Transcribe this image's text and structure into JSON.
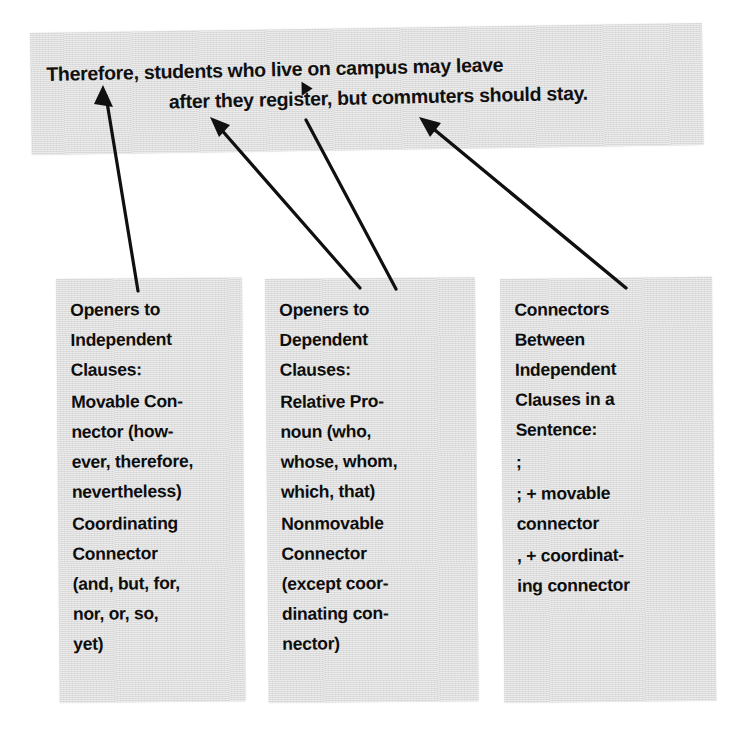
{
  "banner": {
    "line1": "Therefore, students who live on campus may leave",
    "line2": "after they register, but commuters should stay.",
    "marker": "triangle-marker"
  },
  "columns": [
    {
      "id": "openers-independent",
      "blocks": [
        {
          "lines": [
            "Openers to",
            "Independent",
            "Clauses:"
          ]
        },
        {
          "lines": [
            "Movable Con-",
            "nector (how-",
            "ever, therefore,",
            "nevertheless)"
          ]
        },
        {
          "lines": [
            "Coordinating",
            "Connector",
            "(and, but, for,",
            "nor, or, so,",
            "yet)"
          ]
        }
      ]
    },
    {
      "id": "openers-dependent",
      "blocks": [
        {
          "lines": [
            "Openers to",
            "Dependent",
            "Clauses:"
          ]
        },
        {
          "lines": [
            "Relative Pro-",
            "noun (who,",
            "whose, whom,",
            "which, that)"
          ]
        },
        {
          "lines": [
            "Nonmovable",
            "Connector",
            "(except coor-",
            "dinating con-",
            "nector)"
          ]
        }
      ]
    },
    {
      "id": "connectors-between-independent",
      "blocks": [
        {
          "lines": [
            "Connectors",
            "Between",
            "Independent",
            "Clauses in a",
            "Sentence:"
          ]
        },
        {
          "lines": [
            ";"
          ]
        },
        {
          "lines": [
            "; + movable",
            "connector"
          ]
        },
        {
          "lines": [
            ", + coordinat-",
            "ing connector"
          ]
        }
      ]
    }
  ],
  "arrows": [
    {
      "name": "arrow-to-therefore",
      "from_column": "openers-independent",
      "points_to": "Therefore,",
      "head": true
    },
    {
      "name": "arrow-to-after",
      "from_column": "openers-dependent",
      "points_to": "after",
      "head": true
    },
    {
      "name": "arrow-to-who",
      "from_column": "openers-dependent",
      "points_to": "who",
      "head": false
    },
    {
      "name": "arrow-to-but-commuters",
      "from_column": "connectors-between-independent",
      "points_to": "but",
      "head": true
    }
  ],
  "colors": {
    "paper": "#dcdcdc",
    "ink": "#101010",
    "background": "#ffffff"
  }
}
